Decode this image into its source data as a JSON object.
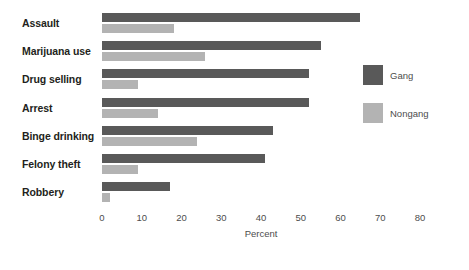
{
  "chart_data": {
    "type": "bar",
    "orientation": "horizontal",
    "title": "",
    "xlabel": "Percent",
    "ylabel": "",
    "xlim": [
      0,
      80
    ],
    "xticks": [
      0,
      10,
      20,
      30,
      40,
      50,
      60,
      70,
      80
    ],
    "xtick_labels": [
      "0",
      "10",
      "20",
      "30",
      "40",
      "50",
      "60",
      "70",
      "80"
    ],
    "grid": false,
    "legend_position": "right",
    "categories": [
      "Assault",
      "Marijuana use",
      "Drug selling",
      "Arrest",
      "Binge drinking",
      "Felony theft",
      "Robbery"
    ],
    "series": [
      {
        "name": "Gang",
        "color": "#595959",
        "values": [
          65,
          55,
          52,
          52,
          43,
          41,
          17
        ]
      },
      {
        "name": "Nongang",
        "color": "#b3b3b3",
        "values": [
          18,
          26,
          9,
          14,
          24,
          9,
          2
        ]
      }
    ]
  },
  "legend": {
    "entries": [
      {
        "label": "Gang",
        "color": "#595959"
      },
      {
        "label": "Nongang",
        "color": "#b3b3b3"
      }
    ]
  }
}
